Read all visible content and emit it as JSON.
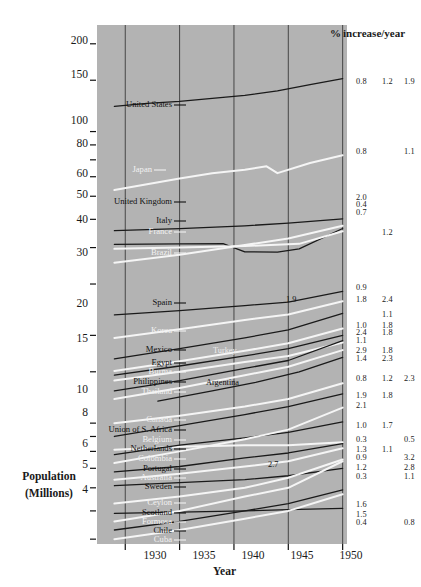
{
  "figure": {
    "header_percent_symbol": "%",
    "header_text": "increase/year",
    "y_axis_title_line1": "Population",
    "y_axis_title_line2": "(Millions)",
    "x_axis_title": "Year",
    "plot_background_color": "#b3b3b3",
    "dark_line_color": "#1a1a1a",
    "light_line_color": "#f5f5f5"
  },
  "chart_data": {
    "type": "line",
    "title": "",
    "subtitle": "",
    "xlabel": "Year",
    "ylabel": "Population (Millions)",
    "yscale": "log",
    "ylim": [
      4,
      230
    ],
    "xlim": [
      1927,
      1950
    ],
    "grid": "vertical gridlines at each labeled year",
    "legend": "inline labels at left end of each curve; % increase/year columns at right",
    "x_ticks": [
      1930,
      1935,
      1940,
      1945,
      1950
    ],
    "y_ticks_labeled": [
      200,
      150,
      100,
      80,
      60,
      50,
      40,
      30,
      20,
      15,
      10,
      8,
      6,
      5,
      4
    ],
    "y_ticks_minor": [
      90,
      70,
      9,
      7
    ],
    "percent_columns": [
      "col1",
      "col2",
      "col3"
    ],
    "annotations": [
      {
        "text": "1.9",
        "x": 1943.0,
        "y": 25.6
      },
      {
        "text": "2.7",
        "x": 1940.2,
        "y": 6.55
      }
    ],
    "series": [
      {
        "name": "United States",
        "color": "dark",
        "label_side": "left",
        "x": [
          1929,
          1932,
          1935,
          1938,
          1941,
          1944,
          1947,
          1950
        ],
        "values": [
          122,
          125,
          127,
          130,
          133,
          138,
          145,
          152
        ],
        "pct": [
          "0.8",
          "1.2",
          "1.9"
        ]
      },
      {
        "name": "Japan",
        "color": "light",
        "label_side": "left",
        "x": [
          1929,
          1932,
          1935,
          1938,
          1941,
          1943,
          1944,
          1947,
          1950
        ],
        "values": [
          63,
          66,
          69,
          72,
          74,
          76,
          72,
          78,
          83
        ],
        "pct": [
          "0.8",
          "",
          "1.1"
        ]
      },
      {
        "name": "United Kingdom",
        "color": "dark",
        "label_side": "left",
        "x": [
          1929,
          1935,
          1941,
          1945,
          1950
        ],
        "values": [
          45.7,
          46.5,
          47.5,
          48.5,
          50.2
        ],
        "pct": [
          "2.0",
          "",
          ""
        ]
      },
      {
        "name": "Italy",
        "color": "dark",
        "label_side": "left",
        "x": [
          1929,
          1935,
          1939,
          1941,
          1944,
          1946,
          1950
        ],
        "values": [
          41.0,
          41.2,
          41.3,
          38.7,
          38.6,
          39.6,
          46.5
        ],
        "pct": [
          "0.4",
          "",
          ""
        ]
      },
      {
        "name": "France",
        "color": "light",
        "label_side": "left",
        "x": [
          1929,
          1935,
          1941,
          1946,
          1950
        ],
        "values": [
          39.6,
          40.0,
          40.5,
          41.2,
          45.5
        ],
        "pct": [
          "0.7",
          "1.2",
          ""
        ]
      },
      {
        "name": "Brazil",
        "color": "light",
        "label_side": "left",
        "x": [
          1929,
          1935,
          1941,
          1945,
          1950
        ],
        "values": [
          35.5,
          37.8,
          40.8,
          43.0,
          47.5
        ],
        "pct": [
          "",
          "",
          ""
        ]
      },
      {
        "name": "Spain",
        "color": "dark",
        "label_side": "left",
        "x": [
          1929,
          1935,
          1941,
          1945,
          1950
        ],
        "values": [
          23.5,
          24.3,
          25.3,
          26.0,
          28.3
        ],
        "pct": [
          "0.9",
          "",
          ""
        ]
      },
      {
        "name": "Korea",
        "color": "light",
        "label_side": "left",
        "x": [
          1929,
          1935,
          1941,
          1945,
          1950
        ],
        "values": [
          19.6,
          21.0,
          22.6,
          23.6,
          26.2
        ],
        "pct": [
          "1.8",
          "2.4",
          ""
        ]
      },
      {
        "name": "Mexico",
        "color": "dark",
        "label_side": "left",
        "x": [
          1929,
          1935,
          1941,
          1945,
          1950
        ],
        "values": [
          16.6,
          18.0,
          19.6,
          20.9,
          23.8
        ],
        "pct": [
          "1.0",
          "1.1",
          ""
        ]
      },
      {
        "name": "Turkey",
        "color": "light",
        "label_side": "inline",
        "x": [
          1929,
          1935,
          1941,
          1945,
          1950
        ],
        "values": [
          15.1,
          16.3,
          17.7,
          18.8,
          21.1
        ],
        "pct": [
          "2.4",
          "1.8",
          ""
        ]
      },
      {
        "name": "Egypt",
        "color": "dark",
        "label_side": "left",
        "x": [
          1929,
          1935,
          1941,
          1945,
          1950
        ],
        "values": [
          14.6,
          15.7,
          17.0,
          18.0,
          20.0
        ],
        "pct": [
          "1.1",
          "1.8",
          ""
        ]
      },
      {
        "name": "Burma",
        "color": "light",
        "label_side": "left",
        "x": [
          1929,
          1935,
          1941,
          1945,
          1950
        ],
        "values": [
          14.0,
          15.0,
          16.2,
          17.0,
          18.9
        ],
        "pct": [
          "2.9",
          "1.8",
          ""
        ]
      },
      {
        "name": "Philippines",
        "color": "dark",
        "label_side": "left",
        "x": [
          1929,
          1935,
          1941,
          1945,
          1950
        ],
        "values": [
          12.9,
          14.0,
          15.4,
          16.4,
          19.2
        ],
        "pct": [
          "1.4",
          "2.3",
          ""
        ]
      },
      {
        "name": "Thailand",
        "color": "light",
        "label_side": "left",
        "x": [
          1929,
          1935,
          1941,
          1945,
          1950
        ],
        "values": [
          12.1,
          13.2,
          14.6,
          15.6,
          17.8
        ],
        "pct": [
          "0.8",
          "1.2",
          "2.3"
        ]
      },
      {
        "name": "Argentina",
        "color": "dark",
        "label_side": "inline",
        "x": [
          1933,
          1938,
          1942,
          1946,
          1950
        ],
        "values": [
          11.9,
          12.9,
          13.8,
          15.0,
          16.8
        ],
        "pct": [
          "1.9",
          "1.8",
          ""
        ]
      },
      {
        "name": "Canada",
        "color": "light",
        "label_side": "left",
        "x": [
          1929,
          1935,
          1941,
          1945,
          1950
        ],
        "values": [
          10.0,
          10.6,
          11.4,
          12.1,
          13.7
        ],
        "pct": [
          "2.1",
          "",
          ""
        ]
      },
      {
        "name": "Union of S. Africa",
        "color": "dark",
        "label_side": "left",
        "x": [
          1929,
          1935,
          1941,
          1945,
          1950
        ],
        "values": [
          9.0,
          9.8,
          10.7,
          11.4,
          12.6
        ],
        "pct": [
          "1.0",
          "1.7",
          ""
        ]
      },
      {
        "name": "Belgium",
        "color": "light",
        "label_side": "left",
        "x": [
          1929,
          1935,
          1941,
          1945,
          1950
        ],
        "values": [
          8.1,
          8.3,
          8.4,
          8.4,
          8.6
        ],
        "pct": [
          "0.3",
          "",
          "0.5"
        ]
      },
      {
        "name": "Netherlands",
        "color": "dark",
        "label_side": "left",
        "x": [
          1929,
          1935,
          1941,
          1945,
          1950
        ],
        "values": [
          7.8,
          8.4,
          8.9,
          9.3,
          10.1
        ],
        "pct": [
          "1.3",
          "1.1",
          ""
        ]
      },
      {
        "name": "Colombia",
        "color": "light",
        "label_side": "left",
        "x": [
          1929,
          1935,
          1941,
          1945,
          1950
        ],
        "values": [
          7.3,
          8.0,
          8.8,
          9.5,
          11.3
        ],
        "pct": [
          "0.9",
          "",
          "3.2"
        ]
      },
      {
        "name": "Portugal",
        "color": "dark",
        "label_side": "left",
        "x": [
          1929,
          1935,
          1941,
          1945,
          1950
        ],
        "values": [
          6.8,
          7.1,
          7.6,
          7.9,
          8.5
        ],
        "pct": [
          "1.2",
          "",
          "2.8"
        ]
      },
      {
        "name": "Australia",
        "color": "light",
        "label_side": "left",
        "x": [
          1929,
          1935,
          1941,
          1945,
          1950
        ],
        "values": [
          6.4,
          6.7,
          7.1,
          7.4,
          8.2
        ],
        "pct": [
          "0.3",
          "",
          "1.1"
        ]
      },
      {
        "name": "Sweden",
        "color": "dark",
        "label_side": "left",
        "x": [
          1929,
          1935,
          1941,
          1945,
          1950
        ],
        "values": [
          6.1,
          6.25,
          6.4,
          6.6,
          7.0
        ],
        "pct": [
          "",
          "",
          ""
        ]
      },
      {
        "name": "Ceylon",
        "color": "light",
        "label_side": "left",
        "x": [
          1929,
          1935,
          1941,
          1945,
          1950
        ],
        "values": [
          5.3,
          5.6,
          6.0,
          6.5,
          7.5
        ],
        "pct": [
          "1.6",
          "",
          ""
        ]
      },
      {
        "name": "Scotland",
        "color": "dark",
        "label_side": "left",
        "x": [
          1929,
          1935,
          1941,
          1945,
          1950
        ],
        "values": [
          4.9,
          4.95,
          5.0,
          5.05,
          5.1
        ],
        "pct": [
          "1.5",
          "",
          ""
        ]
      },
      {
        "name": "Formosa",
        "color": "light",
        "label_side": "left",
        "x": [
          1929,
          1935,
          1941,
          1945,
          1950
        ],
        "values": [
          4.6,
          5.0,
          5.6,
          6.0,
          7.4
        ],
        "pct": [
          "0.4",
          "",
          "0.8"
        ]
      },
      {
        "name": "Chile",
        "color": "dark",
        "label_side": "left",
        "x": [
          1929,
          1935,
          1941,
          1945,
          1950
        ],
        "values": [
          4.3,
          4.6,
          5.0,
          5.3,
          5.9
        ],
        "pct": [
          "",
          "",
          ""
        ]
      },
      {
        "name": "Cuba",
        "color": "light",
        "label_side": "left",
        "x": [
          1929,
          1935,
          1941,
          1945,
          1950
        ],
        "values": [
          4.0,
          4.3,
          4.7,
          5.0,
          5.7
        ],
        "pct": [
          "",
          "",
          ""
        ]
      }
    ]
  },
  "y_tick_labels": [
    {
      "v": "200",
      "y": 42
    },
    {
      "v": "150",
      "y": 76
    },
    {
      "v": "100",
      "y": 122
    },
    {
      "v": "80",
      "y": 145
    },
    {
      "v": "60",
      "y": 175
    },
    {
      "v": "50",
      "y": 196
    },
    {
      "v": "40",
      "y": 221
    },
    {
      "v": "30",
      "y": 254
    },
    {
      "v": "20",
      "y": 305
    },
    {
      "v": "15",
      "y": 340
    },
    {
      "v": "10",
      "y": 391
    },
    {
      "v": "8",
      "y": 414
    },
    {
      "v": "6",
      "y": 445
    },
    {
      "v": "5",
      "y": 466
    },
    {
      "v": "4",
      "y": 491
    }
  ],
  "x_tick_labels": [
    {
      "v": "1930",
      "x": 155
    },
    {
      "v": "1935",
      "x": 204
    },
    {
      "v": "1940",
      "x": 253
    },
    {
      "v": "1945",
      "x": 302
    },
    {
      "v": "1950",
      "x": 351
    }
  ],
  "country_labels": [
    {
      "t": "United States",
      "x": 172,
      "y": 105,
      "c": "dark"
    },
    {
      "t": "Japan",
      "x": 152,
      "y": 170,
      "c": "light"
    },
    {
      "t": "United Kingdom",
      "x": 172,
      "y": 202,
      "c": "dark"
    },
    {
      "t": "Italy",
      "x": 172,
      "y": 221,
      "c": "dark"
    },
    {
      "t": "France",
      "x": 172,
      "y": 232,
      "c": "light"
    },
    {
      "t": "Brazil",
      "x": 172,
      "y": 253,
      "c": "light"
    },
    {
      "t": "Spain",
      "x": 172,
      "y": 303,
      "c": "dark"
    },
    {
      "t": "Korea",
      "x": 172,
      "y": 331,
      "c": "light"
    },
    {
      "t": "Mexico",
      "x": 172,
      "y": 350,
      "c": "dark"
    },
    {
      "t": "Egypt",
      "x": 172,
      "y": 363,
      "c": "dark"
    },
    {
      "t": "Burma",
      "x": 172,
      "y": 372,
      "c": "light"
    },
    {
      "t": "Philippines",
      "x": 172,
      "y": 382,
      "c": "dark"
    },
    {
      "t": "Thailand",
      "x": 172,
      "y": 392,
      "c": "light"
    },
    {
      "t": "Canada",
      "x": 172,
      "y": 420,
      "c": "light"
    },
    {
      "t": "Union of S. Africa",
      "x": 172,
      "y": 430,
      "c": "dark"
    },
    {
      "t": "Belgium",
      "x": 172,
      "y": 440,
      "c": "light"
    },
    {
      "t": "Netherlands",
      "x": 172,
      "y": 449,
      "c": "dark"
    },
    {
      "t": "Colombia",
      "x": 172,
      "y": 459,
      "c": "light"
    },
    {
      "t": "Portugal",
      "x": 172,
      "y": 469,
      "c": "dark"
    },
    {
      "t": "Australia",
      "x": 172,
      "y": 478,
      "c": "light"
    },
    {
      "t": "Sweden",
      "x": 172,
      "y": 487,
      "c": "dark"
    },
    {
      "t": "Ceylon",
      "x": 172,
      "y": 503,
      "c": "light"
    },
    {
      "t": "Scotland",
      "x": 172,
      "y": 513,
      "c": "dark"
    },
    {
      "t": "Formosa",
      "x": 172,
      "y": 522,
      "c": "light"
    },
    {
      "t": "Chile",
      "x": 172,
      "y": 531,
      "c": "dark"
    },
    {
      "t": "Cuba",
      "x": 172,
      "y": 540,
      "c": "light"
    }
  ],
  "inline_labels": [
    {
      "t": "Turkey",
      "x": 213,
      "y": 352,
      "c": "light"
    },
    {
      "t": "Argentina",
      "x": 206,
      "y": 384,
      "c": "dark"
    },
    {
      "t": "1.9",
      "x": 286,
      "y": 301,
      "c": "dark"
    },
    {
      "t": "2.7",
      "x": 268,
      "y": 466,
      "c": "dark"
    }
  ],
  "percent_cells": [
    {
      "t": "0.8",
      "x": 356,
      "y": 82
    },
    {
      "t": "1.2",
      "x": 382,
      "y": 82
    },
    {
      "t": "1.9",
      "x": 404,
      "y": 82
    },
    {
      "t": "0.8",
      "x": 356,
      "y": 152
    },
    {
      "t": "1.1",
      "x": 404,
      "y": 152
    },
    {
      "t": "2.0",
      "x": 356,
      "y": 198
    },
    {
      "t": "0.4",
      "x": 356,
      "y": 205
    },
    {
      "t": "0.7",
      "x": 356,
      "y": 213
    },
    {
      "t": "1.2",
      "x": 382,
      "y": 233
    },
    {
      "t": "0.9",
      "x": 356,
      "y": 288
    },
    {
      "t": "1.8",
      "x": 356,
      "y": 300
    },
    {
      "t": "2.4",
      "x": 382,
      "y": 300
    },
    {
      "t": "1.1",
      "x": 382,
      "y": 315
    },
    {
      "t": "1.0",
      "x": 356,
      "y": 326
    },
    {
      "t": "1.8",
      "x": 382,
      "y": 326
    },
    {
      "t": "2.4",
      "x": 356,
      "y": 333
    },
    {
      "t": "1.8",
      "x": 382,
      "y": 333
    },
    {
      "t": "1.1",
      "x": 356,
      "y": 341
    },
    {
      "t": "2.9",
      "x": 356,
      "y": 351
    },
    {
      "t": "1.8",
      "x": 382,
      "y": 351
    },
    {
      "t": "1.4",
      "x": 356,
      "y": 359
    },
    {
      "t": "2.3",
      "x": 382,
      "y": 359
    },
    {
      "t": "0.8",
      "x": 356,
      "y": 379
    },
    {
      "t": "1.2",
      "x": 382,
      "y": 379
    },
    {
      "t": "2.3",
      "x": 404,
      "y": 379
    },
    {
      "t": "1.9",
      "x": 356,
      "y": 396
    },
    {
      "t": "1.8",
      "x": 382,
      "y": 396
    },
    {
      "t": "2.1",
      "x": 356,
      "y": 406
    },
    {
      "t": "1.0",
      "x": 356,
      "y": 426
    },
    {
      "t": "1.7",
      "x": 382,
      "y": 426
    },
    {
      "t": "0.3",
      "x": 356,
      "y": 440
    },
    {
      "t": "0.5",
      "x": 404,
      "y": 440
    },
    {
      "t": "1.3",
      "x": 356,
      "y": 450
    },
    {
      "t": "1.1",
      "x": 382,
      "y": 450
    },
    {
      "t": "0.9",
      "x": 356,
      "y": 458
    },
    {
      "t": "3.2",
      "x": 404,
      "y": 458
    },
    {
      "t": "1.2",
      "x": 356,
      "y": 468
    },
    {
      "t": "2.8",
      "x": 404,
      "y": 468
    },
    {
      "t": "0.3",
      "x": 356,
      "y": 477
    },
    {
      "t": "1.1",
      "x": 404,
      "y": 477
    },
    {
      "t": "1.6",
      "x": 356,
      "y": 505
    },
    {
      "t": "1.5",
      "x": 356,
      "y": 515
    },
    {
      "t": "0.4",
      "x": 356,
      "y": 523
    },
    {
      "t": "0.8",
      "x": 404,
      "y": 523
    }
  ]
}
